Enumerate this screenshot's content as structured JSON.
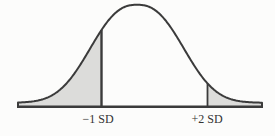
{
  "figure": {
    "name": "normal distribution curve with shaded tails",
    "colors": {
      "background": "#fcfcfb",
      "curve_stroke": "#3b3b3b",
      "shade_fill": "#dcdcda",
      "label_text": "#333333"
    },
    "labels": {
      "left_tick": "−1 SD",
      "right_tick": "+2 SD"
    }
  },
  "chart_data": {
    "type": "area",
    "distribution": "normal",
    "x_unit": "standard deviations from the mean",
    "annotations": [
      {
        "label": "−1 SD",
        "sd": -1
      },
      {
        "label": "+2 SD",
        "sd": 2
      }
    ],
    "shaded_regions": [
      {
        "region": "left tail",
        "from_sd": null,
        "to_sd": -1
      },
      {
        "region": "right tail",
        "from_sd": 2,
        "to_sd": null
      }
    ],
    "axes": {
      "x_axis_visible": true,
      "y_axis_visible": false,
      "grid": false,
      "tick_label_position": "below baseline"
    },
    "pixel_geometry": {
      "canvas_w": 275,
      "canvas_h": 136,
      "mean_x": 137,
      "baseline_y": 106.8,
      "peak_height": 102,
      "tail_height": 4,
      "shape_width": 58,
      "shape_exponent": 2.47,
      "left_x": 18,
      "right_x": 262,
      "tick1_x": 101.5,
      "tick2_x": 207.5,
      "curve_stroke_w": 2,
      "baseline_stroke_w": 2.4,
      "tick1_stroke_w": 2.4,
      "tick2_stroke_w": 1.8,
      "label1_x": 98,
      "label2_x": 207,
      "label_y": 123
    }
  }
}
